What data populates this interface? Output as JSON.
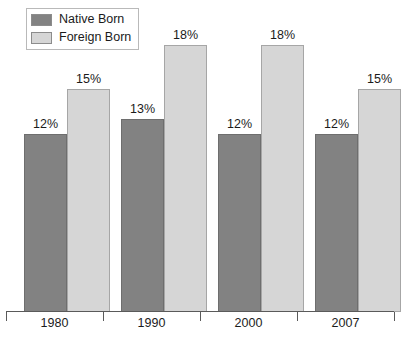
{
  "chart_data": {
    "type": "bar",
    "title": "",
    "subtitle": "",
    "xlabel": "",
    "ylabel": "",
    "ylim": [
      0,
      21
    ],
    "grid": false,
    "legend_position": "top-left",
    "value_suffix": "%",
    "categories": [
      "1980",
      "1990",
      "2000",
      "2007"
    ],
    "series": [
      {
        "name": "Native Born",
        "color": "#828282",
        "values": [
          12,
          13,
          12,
          12
        ],
        "labels": [
          "12%",
          "13%",
          "12%",
          "12%"
        ]
      },
      {
        "name": "Foreign Born",
        "color": "#d6d6d6",
        "values": [
          15,
          18,
          18,
          15
        ],
        "labels": [
          "15%",
          "18%",
          "18%",
          "15%"
        ]
      }
    ]
  },
  "legend": {
    "items": [
      {
        "label": "Native Born",
        "color": "#828282"
      },
      {
        "label": "Foreign Born",
        "color": "#d6d6d6"
      }
    ]
  },
  "axis": {
    "categories": [
      "1980",
      "1990",
      "2000",
      "2007"
    ]
  },
  "bars": [
    {
      "label": "12%",
      "series": "Native Born",
      "category": "1980"
    },
    {
      "label": "15%",
      "series": "Foreign Born",
      "category": "1980"
    },
    {
      "label": "13%",
      "series": "Native Born",
      "category": "1990"
    },
    {
      "label": "18%",
      "series": "Foreign Born",
      "category": "1990"
    },
    {
      "label": "12%",
      "series": "Native Born",
      "category": "2000"
    },
    {
      "label": "18%",
      "series": "Foreign Born",
      "category": "2000"
    },
    {
      "label": "12%",
      "series": "Native Born",
      "category": "2007"
    },
    {
      "label": "15%",
      "series": "Foreign Born",
      "category": "2007"
    }
  ]
}
